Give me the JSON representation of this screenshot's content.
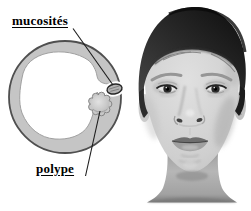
{
  "figure": {
    "diagram": {
      "label_mucosites": "mucosités",
      "label_polype": "polype",
      "colors": {
        "ring_fill": "#c5c5c5",
        "ring_outline": "#4f4f4f",
        "cavity_fill": "#ffffff",
        "cavity_edge": "#a0a0a0",
        "polyp_fill": "#c8c8c8",
        "polyp_edge": "#858585",
        "pocket_fill": "#b2b2b2",
        "pocket_outline": "#262626",
        "leader_line": "#1c1c1c",
        "label_text": "#000000"
      }
    },
    "photo": {
      "alt": "grayscale frontal portrait of a woman with short dark hair",
      "colors": {
        "background": "#ffffff",
        "hair_dark": "#101010",
        "hair_mid": "#3f3f3f",
        "skin_light": "#dedede",
        "skin_mid": "#c6c6c6",
        "shadow": "#8c8c8c"
      }
    }
  }
}
